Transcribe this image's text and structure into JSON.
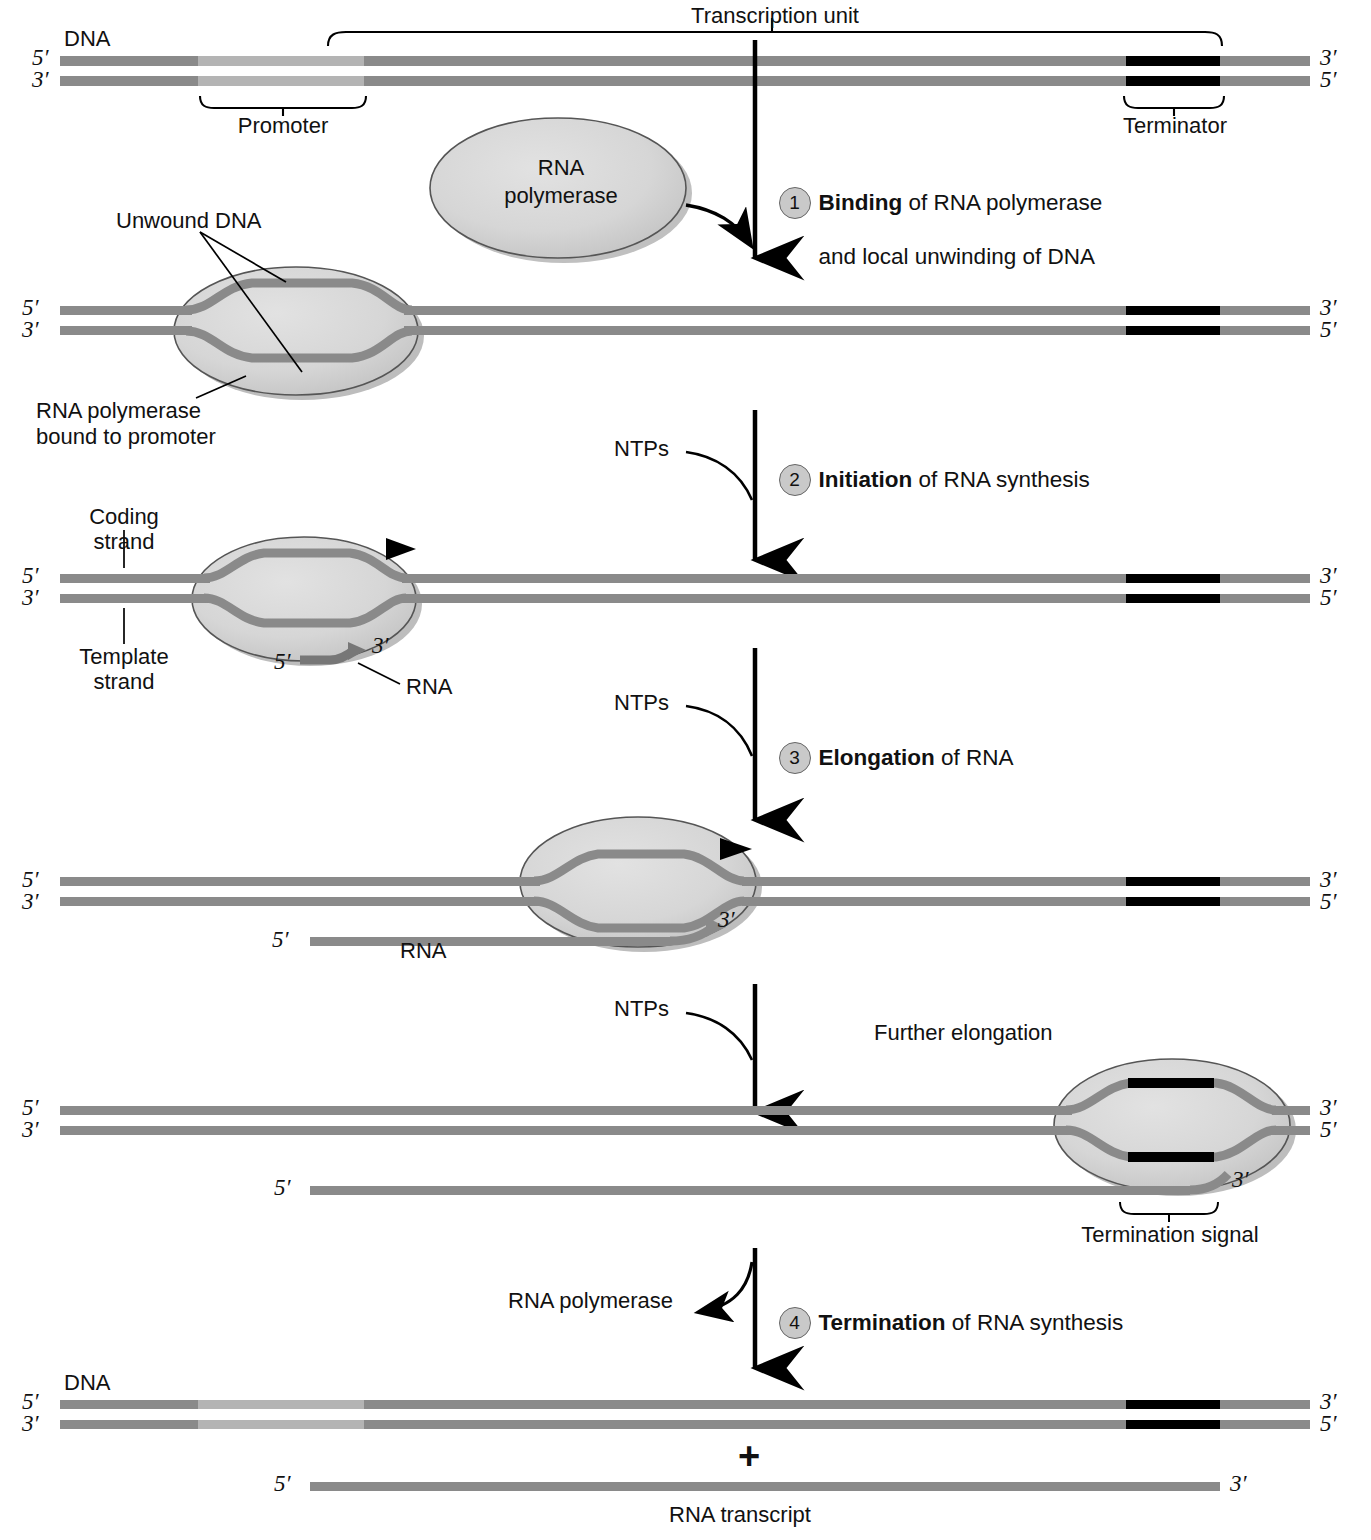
{
  "figure": {
    "colors": {
      "dna_strand": "#8a8a8a",
      "dna_strand_light": "#b0b0b0",
      "rna_strand": "#8a8a8a",
      "polymerase_fill": "#d6d6d6",
      "polymerase_shadow": "#b9b9b9",
      "terminator_black": "#000000",
      "line": "#000000",
      "step_badge_fill": "#c9c9c9"
    }
  },
  "panel1": {
    "dna_label": "DNA",
    "five_prime_left": "5′",
    "three_prime_left": "3′",
    "three_prime_right": "3′",
    "five_prime_right": "5′",
    "transcription_unit": "Transcription unit",
    "promoter": "Promoter",
    "terminator": "Terminator"
  },
  "polymerase_free": {
    "line1": "RNA",
    "line2": "polymerase"
  },
  "steps": [
    {
      "number": "1",
      "bold": "Binding",
      "rest_line1": " of RNA polymerase",
      "rest_line2": "and local unwinding of DNA"
    },
    {
      "number": "2",
      "bold": "Initiation",
      "rest_line1": " of RNA synthesis",
      "rest_line2": ""
    },
    {
      "number": "3",
      "bold": "Elongation",
      "rest_line1": " of RNA",
      "rest_line2": ""
    },
    {
      "number": "4",
      "bold": "Termination",
      "rest_line1": " of RNA synthesis",
      "rest_line2": ""
    }
  ],
  "panel2": {
    "five_prime_left": "5′",
    "three_prime_left": "3′",
    "three_prime_right": "3′",
    "five_prime_right": "5′",
    "unwound_dna": "Unwound DNA",
    "bound_line1": "RNA polymerase",
    "bound_line2": "bound to promoter"
  },
  "panel3": {
    "five_prime_left": "5′",
    "three_prime_left": "3′",
    "three_prime_right": "3′",
    "five_prime_right": "5′",
    "coding_line1": "Coding",
    "coding_line2": "strand",
    "template_line1": "Template",
    "template_line2": "strand",
    "rna_five_prime": "5′",
    "rna_three_prime": "3′",
    "rna_label": "RNA",
    "ntps": "NTPs"
  },
  "panel4": {
    "five_prime_left": "5′",
    "three_prime_left": "3′",
    "three_prime_right": "3′",
    "five_prime_right": "5′",
    "rna_five_prime": "5′",
    "rna_three_prime": "3′",
    "rna_label": "RNA",
    "ntps": "NTPs"
  },
  "further": {
    "ntps": "NTPs",
    "label": "Further elongation"
  },
  "panel5": {
    "five_prime_left": "5′",
    "three_prime_left": "3′",
    "three_prime_right": "3′",
    "five_prime_right": "5′",
    "rna_five_prime": "5′",
    "rna_three_prime": "3′",
    "termination_signal": "Termination signal"
  },
  "termination": {
    "released_polymerase": "RNA polymerase"
  },
  "panel6": {
    "dna_label": "DNA",
    "five_prime_left": "5′",
    "three_prime_left": "3′",
    "three_prime_right": "3′",
    "five_prime_right": "5′",
    "plus": "+",
    "rna_five_prime": "5′",
    "rna_three_prime": "3′",
    "rna_transcript": "RNA transcript"
  }
}
